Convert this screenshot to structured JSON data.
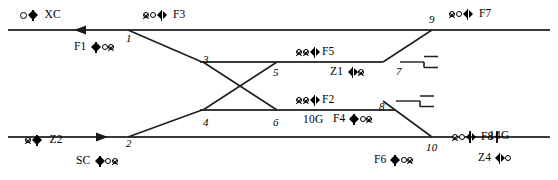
{
  "diagram": {
    "type": "railway-signalling-layout",
    "colors": {
      "track": "#3a3a3a",
      "branch": "#222222",
      "text": "#000000",
      "background": "#ffffff"
    },
    "signals": [
      {
        "id": "XC",
        "label": "XC",
        "x": 20,
        "y": 9,
        "glyph": "circle-mast",
        "label_side": "right"
      },
      {
        "id": "F3",
        "label": "F3",
        "x": 143,
        "y": 9,
        "glyph": "circle-circle-mast",
        "label_side": "right"
      },
      {
        "id": "F7",
        "label": "F7",
        "x": 449,
        "y": 8,
        "glyph": "circle-circle-mast",
        "label_side": "right"
      },
      {
        "id": "F1",
        "label": "F1",
        "x": 92,
        "y": 41,
        "glyph": "mast-circle-circle",
        "label_side": "left"
      },
      {
        "id": "F5",
        "label": "F5",
        "x": 296,
        "y": 46,
        "glyph": "circle-circle-mast",
        "label_side": "right"
      },
      {
        "id": "Z1",
        "label": "Z1",
        "x": 347,
        "y": 66,
        "glyph": "mast-circle",
        "label_side": "left"
      },
      {
        "id": "F2",
        "label": "F2",
        "x": 296,
        "y": 94,
        "glyph": "circle-circle-mast",
        "label_side": "right"
      },
      {
        "id": "F4",
        "label": "F4",
        "x": 350,
        "y": 114,
        "glyph": "mast-circle-circle",
        "label_side": "left"
      },
      {
        "id": "Z2",
        "label": "Z2",
        "x": 25,
        "y": 134,
        "glyph": "circle-mast",
        "label_side": "right"
      },
      {
        "id": "SC",
        "label": "SC",
        "x": 96,
        "y": 155,
        "glyph": "mast-circle-circle",
        "label_side": "left"
      },
      {
        "id": "F6",
        "label": "F6",
        "x": 392,
        "y": 154,
        "glyph": "mast-circle-circle",
        "label_side": "left"
      },
      {
        "id": "F8",
        "label": "F8",
        "x": 452,
        "y": 131,
        "glyph": "circle-circle-mast",
        "label_side": "right"
      },
      {
        "id": "Z4",
        "label": "Z4",
        "x": 495,
        "y": 152,
        "glyph": "mast-circle",
        "label_side": "left"
      }
    ],
    "switches": [
      {
        "label": "1",
        "x": 126,
        "y": 33
      },
      {
        "label": "2",
        "x": 126,
        "y": 138
      },
      {
        "label": "3",
        "x": 203,
        "y": 55
      },
      {
        "label": "4",
        "x": 203,
        "y": 117
      },
      {
        "label": "5",
        "x": 273,
        "y": 68
      },
      {
        "label": "6",
        "x": 273,
        "y": 117
      },
      {
        "label": "7",
        "x": 398,
        "y": 68
      },
      {
        "label": "8",
        "x": 380,
        "y": 101
      },
      {
        "label": "9",
        "x": 430,
        "y": 14
      },
      {
        "label": "10",
        "x": 428,
        "y": 143
      }
    ],
    "sections": [
      {
        "label": "10G",
        "x": 303,
        "y": 114
      },
      {
        "label": "14G",
        "x": 490,
        "y": 131
      }
    ],
    "tracks": {
      "top_main_y": 30,
      "bottom_main_y": 137,
      "upper_siding_y": 62,
      "lower_siding_y": 110
    }
  }
}
